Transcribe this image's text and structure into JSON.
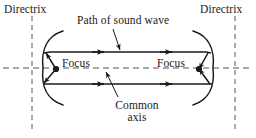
{
  "figure": {
    "labels": {
      "directrix_left": "Directrix",
      "directrix_right": "Directrix",
      "path_of_sound_wave": "Path of sound wave",
      "focus_left": "Focus",
      "focus_right": "Focus",
      "common_axis_line1": "Common",
      "common_axis_line2": "axis"
    },
    "colors": {
      "stroke": "#1a1a1a",
      "dashed": "#555555",
      "background": "#ffffff"
    },
    "geometry": {
      "left_directrix_x": 32,
      "right_directrix_x": 235,
      "common_axis_y": 68,
      "left_focus": {
        "x": 56,
        "y": 69
      },
      "right_focus": {
        "x": 199,
        "y": 69
      },
      "left_arc_vertex_x": 43,
      "right_arc_vertex_x": 213,
      "upper_ray_y": 52,
      "lower_ray_y": 84,
      "ray_x_start": 50,
      "ray_x_end": 206
    },
    "icons": {
      "focus_point": "focus-dot-icon",
      "arrowhead": "arrowhead-icon",
      "leader": "leader-line-icon"
    }
  }
}
